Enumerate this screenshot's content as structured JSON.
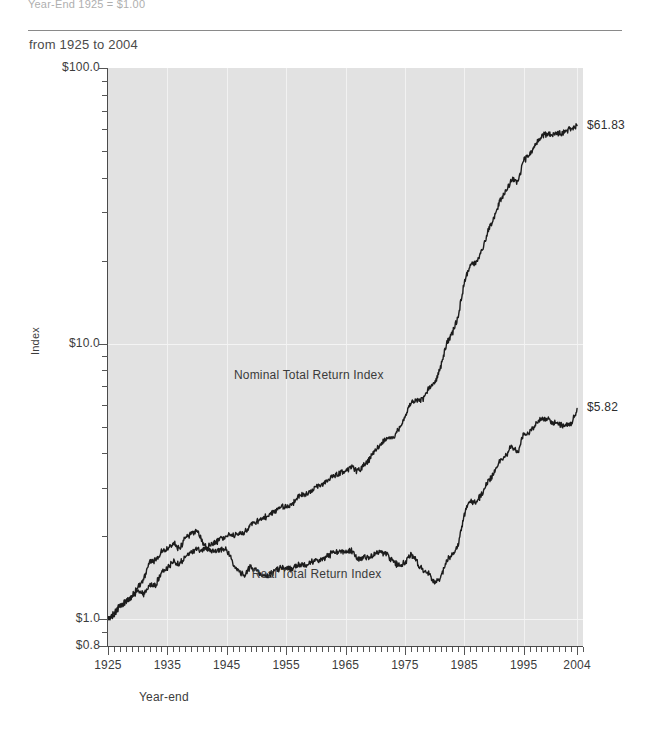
{
  "header": {
    "note": "Year-End 1925 = $1.00",
    "subtitle": "from 1925 to 2004"
  },
  "chart_data": {
    "type": "line",
    "title": "",
    "subtitle": "from 1925 to 2004",
    "xlabel": "Year-end",
    "ylabel": "Index",
    "yscale": "log",
    "ylim": [
      0.8,
      100.0
    ],
    "xlim": [
      1925,
      2005
    ],
    "grid": true,
    "legend_position": "inline-annotation",
    "y_tick_labels": [
      "$100.0",
      "$10.0",
      "$1.0",
      "$0.8"
    ],
    "y_tick_values": [
      100.0,
      10.0,
      1.0,
      0.8
    ],
    "x_tick_labels": [
      "1925",
      "1935",
      "1945",
      "1955",
      "1965",
      "1975",
      "1985",
      "1995",
      "2004"
    ],
    "x_tick_values": [
      1925,
      1935,
      1945,
      1955,
      1965,
      1975,
      1985,
      1995,
      2004
    ],
    "annotations": [
      {
        "text": "Nominal Total Return Index",
        "x": 1958,
        "y": 7.6
      },
      {
        "text": "Real Total Return Index",
        "x": 1961,
        "y": 1.45
      }
    ],
    "endpoint_labels": [
      {
        "text": "$61.83",
        "series": "Nominal Total Return Index",
        "value": 61.83
      },
      {
        "text": "$5.82",
        "series": "Real Total Return Index",
        "value": 5.82
      }
    ],
    "series": [
      {
        "name": "Nominal Total Return Index",
        "color": "#1c1c1c",
        "x": [
          1925,
          1926,
          1927,
          1928,
          1929,
          1930,
          1931,
          1932,
          1933,
          1934,
          1935,
          1936,
          1937,
          1938,
          1939,
          1940,
          1941,
          1942,
          1943,
          1944,
          1945,
          1946,
          1947,
          1948,
          1949,
          1950,
          1951,
          1952,
          1953,
          1954,
          1955,
          1956,
          1957,
          1958,
          1959,
          1960,
          1961,
          1962,
          1963,
          1964,
          1965,
          1966,
          1967,
          1968,
          1969,
          1970,
          1971,
          1972,
          1973,
          1974,
          1975,
          1976,
          1977,
          1978,
          1979,
          1980,
          1981,
          1982,
          1983,
          1984,
          1985,
          1986,
          1987,
          1988,
          1989,
          1990,
          1991,
          1992,
          1993,
          1994,
          1995,
          1996,
          1997,
          1998,
          1999,
          2000,
          2001,
          2002,
          2003,
          2004
        ],
        "y": [
          1.0,
          1.05,
          1.12,
          1.16,
          1.21,
          1.27,
          1.23,
          1.33,
          1.33,
          1.47,
          1.53,
          1.62,
          1.58,
          1.68,
          1.75,
          1.8,
          1.79,
          1.85,
          1.9,
          1.96,
          2.01,
          2.02,
          2.03,
          2.07,
          2.2,
          2.27,
          2.32,
          2.37,
          2.46,
          2.55,
          2.56,
          2.6,
          2.79,
          2.82,
          2.89,
          3.03,
          3.07,
          3.19,
          3.31,
          3.4,
          3.44,
          3.6,
          3.43,
          3.61,
          3.79,
          4.1,
          4.35,
          4.5,
          4.53,
          4.91,
          5.37,
          6.13,
          6.19,
          6.27,
          6.88,
          7.16,
          8.2,
          10.0,
          10.9,
          12.6,
          16.6,
          19.1,
          19.7,
          21.9,
          25.6,
          28.6,
          33.0,
          35.5,
          39.6,
          38.3,
          46.3,
          48.4,
          52.9,
          56.6,
          57.8,
          57.6,
          58.2,
          58.9,
          60.5,
          61.83
        ]
      },
      {
        "name": "Real Total Return Index",
        "color": "#1c1c1c",
        "x": [
          1925,
          1926,
          1927,
          1928,
          1929,
          1930,
          1931,
          1932,
          1933,
          1934,
          1935,
          1936,
          1937,
          1938,
          1939,
          1940,
          1941,
          1942,
          1943,
          1944,
          1945,
          1946,
          1947,
          1948,
          1949,
          1950,
          1951,
          1952,
          1953,
          1954,
          1955,
          1956,
          1957,
          1958,
          1959,
          1960,
          1961,
          1962,
          1963,
          1964,
          1965,
          1966,
          1967,
          1968,
          1969,
          1970,
          1971,
          1972,
          1973,
          1974,
          1975,
          1976,
          1977,
          1978,
          1979,
          1980,
          1981,
          1982,
          1983,
          1984,
          1985,
          1986,
          1987,
          1988,
          1989,
          1990,
          1991,
          1992,
          1993,
          1994,
          1995,
          1996,
          1997,
          1998,
          1999,
          2000,
          2001,
          2002,
          2003,
          2004
        ],
        "y": [
          1.0,
          1.03,
          1.11,
          1.16,
          1.2,
          1.31,
          1.39,
          1.62,
          1.64,
          1.77,
          1.8,
          1.9,
          1.8,
          1.97,
          2.05,
          2.08,
          1.9,
          1.78,
          1.77,
          1.79,
          1.8,
          1.6,
          1.49,
          1.45,
          1.55,
          1.5,
          1.43,
          1.44,
          1.49,
          1.54,
          1.53,
          1.52,
          1.58,
          1.57,
          1.6,
          1.65,
          1.65,
          1.7,
          1.74,
          1.76,
          1.75,
          1.78,
          1.65,
          1.68,
          1.68,
          1.73,
          1.75,
          1.73,
          1.61,
          1.57,
          1.6,
          1.72,
          1.62,
          1.5,
          1.47,
          1.35,
          1.4,
          1.63,
          1.71,
          1.89,
          2.39,
          2.7,
          2.67,
          2.85,
          3.18,
          3.37,
          3.77,
          3.93,
          4.26,
          4.01,
          4.71,
          4.78,
          5.1,
          5.37,
          5.36,
          5.16,
          5.08,
          5.06,
          5.09,
          5.82
        ]
      }
    ]
  }
}
